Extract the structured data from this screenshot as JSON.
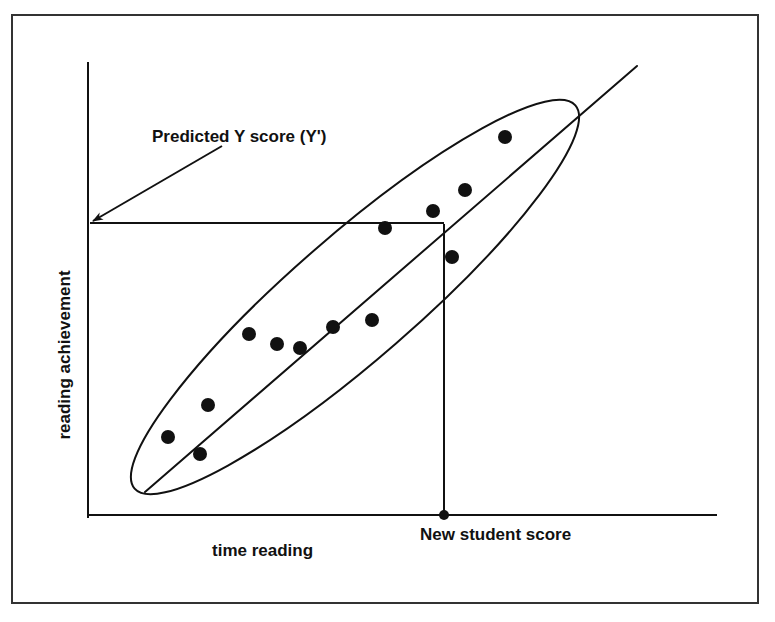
{
  "figure": {
    "background_color": "#ffffff",
    "ink_color": "#111111",
    "border": {
      "name": "figure-border",
      "x": 12,
      "y": 15,
      "width": 746,
      "height": 588,
      "stroke": "#333333",
      "stroke_width": 2
    }
  },
  "labels": {
    "x_axis_label": "time reading",
    "y_axis_label": "reading achievement",
    "predicted_annotation": "Predicted Y score (Y')",
    "new_student_annotation": "New student score"
  },
  "chart_data": {
    "type": "scatter",
    "title": "",
    "xlabel": "time reading",
    "ylabel": "reading achievement",
    "grid": false,
    "legend": "none",
    "axes": {
      "x_axis": {
        "x1": 88,
        "y1": 515,
        "x2": 716,
        "y2": 515,
        "stroke_width": 2
      },
      "y_axis": {
        "x1": 88,
        "y1": 63,
        "x2": 88,
        "y2": 517,
        "stroke_width": 2
      },
      "xlim": [
        0,
        100
      ],
      "ylim": [
        0,
        100
      ],
      "ticks": [],
      "tick_labels": []
    },
    "points": [
      {
        "id": "p1",
        "cx": 168,
        "cy": 437,
        "r": 7
      },
      {
        "id": "p2",
        "cx": 200,
        "cy": 454,
        "r": 7
      },
      {
        "id": "p3",
        "cx": 208,
        "cy": 405,
        "r": 7
      },
      {
        "id": "p4",
        "cx": 249,
        "cy": 334,
        "r": 7
      },
      {
        "id": "p5",
        "cx": 277,
        "cy": 344,
        "r": 7
      },
      {
        "id": "p6",
        "cx": 300,
        "cy": 348,
        "r": 7
      },
      {
        "id": "p7",
        "cx": 333,
        "cy": 327,
        "r": 7
      },
      {
        "id": "p8",
        "cx": 372,
        "cy": 320,
        "r": 7
      },
      {
        "id": "p9",
        "cx": 433,
        "cy": 211,
        "r": 7
      },
      {
        "id": "p10",
        "cx": 385,
        "cy": 228,
        "r": 7
      },
      {
        "id": "p11",
        "cx": 452,
        "cy": 257,
        "r": 7
      },
      {
        "id": "p12",
        "cx": 465,
        "cy": 190,
        "r": 7
      },
      {
        "id": "p13",
        "cx": 505,
        "cy": 137,
        "r": 7
      }
    ],
    "regression_line": {
      "name": "regression-line",
      "x1": 145,
      "y1": 492,
      "x2": 637,
      "y2": 66,
      "stroke_width": 2
    },
    "confidence_ellipse": {
      "name": "scatter-ellipse",
      "cx": 355,
      "cy": 297,
      "rx": 292,
      "ry": 62,
      "rotation_deg": -41,
      "stroke_width": 2,
      "fill": "none"
    },
    "prediction_lines": {
      "horizontal": {
        "name": "predicted-y-line",
        "x1": 90,
        "y1": 223,
        "x2": 444,
        "y2": 223,
        "stroke_width": 2
      },
      "vertical": {
        "name": "new-student-dropline",
        "x1": 444,
        "y1": 224,
        "x2": 444,
        "y2": 515,
        "stroke_width": 2
      },
      "new_student_marker": {
        "cx": 444,
        "cy": 515,
        "r": 5
      }
    },
    "annotations": [
      {
        "id": "predicted-y",
        "text": "Predicted Y score (Y')",
        "text_x": 152,
        "text_y": 142,
        "font_size": 17,
        "anchor": "start",
        "arrow": {
          "x1": 222,
          "y1": 146,
          "x2": 93,
          "y2": 221,
          "head_size": 13
        }
      },
      {
        "id": "new-student",
        "text": "New student score",
        "text_x": 420,
        "text_y": 540,
        "font_size": 17,
        "anchor": "start",
        "arrow": null
      },
      {
        "id": "x-axis-title",
        "text": "time reading",
        "text_x": 212,
        "text_y": 556,
        "font_size": 17,
        "anchor": "start",
        "arrow": null
      },
      {
        "id": "y-axis-title",
        "text": "reading achievement",
        "text_x": 70,
        "text_y": 355,
        "font_size": 17,
        "anchor": "middle",
        "rotation_deg": -90,
        "arrow": null
      }
    ]
  }
}
